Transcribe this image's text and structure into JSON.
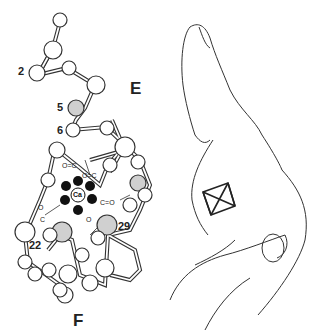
{
  "figure": {
    "molecule": {
      "ion_label": "Ca",
      "helix_labels": {
        "top": "E",
        "bottom": "F"
      },
      "residue_labels": [
        "2",
        "5",
        "6",
        "22",
        "29"
      ],
      "carbonyl_label": "O=C"
    },
    "hand": {
      "description": "right hand: index finger (E helix), thumb (F helix), octahedron (Ca coordination) in the palm"
    },
    "colors": {
      "line": "#333333",
      "ion_ligand": "#111111",
      "shaded_atom": "#d0d0d0",
      "background": "#ffffff"
    }
  }
}
